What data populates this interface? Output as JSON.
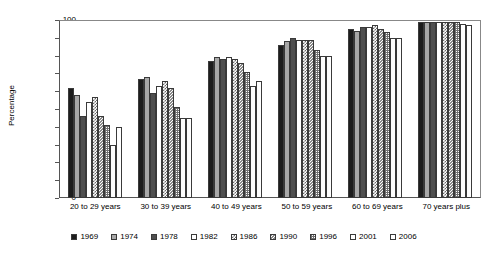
{
  "chart_data": {
    "type": "bar",
    "title": "",
    "xlabel": "",
    "ylabel": "Percentage",
    "ylim": [
      0,
      100
    ],
    "yticks": [
      0,
      10,
      20,
      30,
      40,
      50,
      60,
      70,
      80,
      90,
      100
    ],
    "grid": false,
    "legend_position": "bottom",
    "categories": [
      "20 to 29 years",
      "30 to 39 years",
      "40 to 49 years",
      "50 to 59 years",
      "60 to 69 years",
      "70 years plus"
    ],
    "series": [
      {
        "name": "1969",
        "values": [
          62,
          67,
          77,
          86,
          95,
          99
        ]
      },
      {
        "name": "1974",
        "values": [
          58,
          68,
          79,
          88,
          94,
          99
        ]
      },
      {
        "name": "1978",
        "values": [
          46,
          59,
          78,
          90,
          96,
          99
        ]
      },
      {
        "name": "1982",
        "values": [
          54,
          63,
          79,
          89,
          96,
          99
        ]
      },
      {
        "name": "1986",
        "values": [
          57,
          66,
          78,
          89,
          97,
          99
        ]
      },
      {
        "name": "1990",
        "values": [
          46,
          62,
          76,
          89,
          95,
          99
        ]
      },
      {
        "name": "1996",
        "values": [
          41,
          51,
          71,
          83,
          93,
          99
        ]
      },
      {
        "name": "2001",
        "values": [
          30,
          45,
          63,
          80,
          90,
          98
        ]
      },
      {
        "name": "2006",
        "values": [
          40,
          45,
          66,
          80,
          90,
          97
        ]
      }
    ]
  },
  "axis": {
    "y_title": "Percentage"
  }
}
